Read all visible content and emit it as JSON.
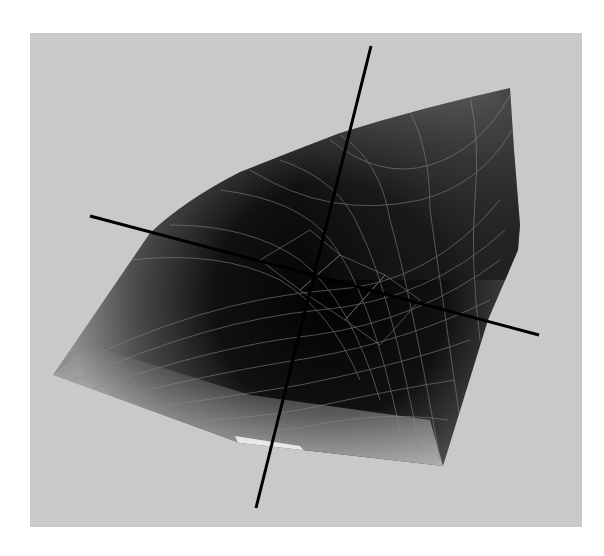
{
  "figure": {
    "colors": {
      "background": "#ffffff",
      "viewport": "#c9c9c9",
      "surface_dark": "#050505",
      "surface_light": "#e6e6e6",
      "mesh_line": "#8a8a8a",
      "axis": "#000000"
    },
    "viewport": {
      "x": 30,
      "y": 33,
      "width": 552,
      "height": 494
    },
    "surface": {
      "outline": [
        [
          53,
          375
        ],
        [
          150,
          233
        ],
        [
          185,
          200
        ],
        [
          240,
          172
        ],
        [
          290,
          152
        ],
        [
          340,
          133
        ],
        [
          420,
          110
        ],
        [
          510,
          88
        ],
        [
          514,
          150
        ],
        [
          520,
          225
        ],
        [
          518,
          250
        ],
        [
          488,
          320
        ],
        [
          443,
          466
        ],
        [
          240,
          443
        ],
        [
          53,
          375
        ]
      ]
    },
    "axes": [
      {
        "name": "vertical-axis",
        "from": [
          371,
          46
        ],
        "to": [
          256,
          508
        ]
      },
      {
        "name": "horizontal-axis",
        "from": [
          90,
          216
        ],
        "to": [
          539,
          335
        ]
      }
    ]
  }
}
